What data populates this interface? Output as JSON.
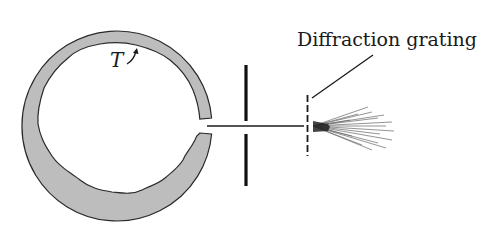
{
  "diagram": {
    "labels": {
      "grating": "Diffraction grating",
      "temperature": "T"
    },
    "components": [
      {
        "id": "cavity",
        "description": "Hollow ring-shaped cavity with rough inner wall and small opening on right"
      },
      {
        "id": "aperture-screen",
        "description": "Opaque vertical screen with slit"
      },
      {
        "id": "light-beam",
        "description": "Horizontal beam exiting cavity opening"
      },
      {
        "id": "diffraction-grating",
        "description": "Dashed vertical line representing grating"
      },
      {
        "id": "diffracted-rays",
        "description": "Fan of rays spreading from grating"
      }
    ],
    "colors": {
      "cavity_fill": "#bdbdbd",
      "stroke": "#1a1a1a",
      "background": "#ffffff"
    }
  }
}
